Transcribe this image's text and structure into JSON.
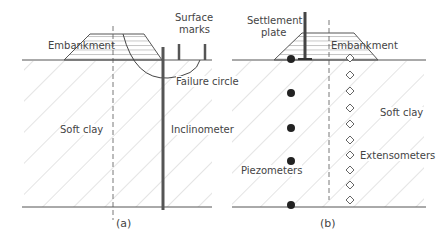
{
  "panel_a": {
    "caption": "(a)",
    "labels": {
      "embankment": "Embankment",
      "surface_marks_line1": "Surface",
      "surface_marks_line2": "marks",
      "failure_circle": "Failure circle",
      "soft_clay": "Soft clay",
      "inclinometer": "Inclinometer"
    }
  },
  "panel_b": {
    "caption": "(b)",
    "labels": {
      "settlement_plate_line1": "Settlement",
      "settlement_plate_line2": "plate",
      "embankment": "Embankment",
      "soft_clay": "Soft clay",
      "piezometers": "Piezometers",
      "extensometers": "Extensometers"
    }
  },
  "colors": {
    "line": "#555555",
    "hatch": "#bbbbbb",
    "instrument": "#333333"
  }
}
